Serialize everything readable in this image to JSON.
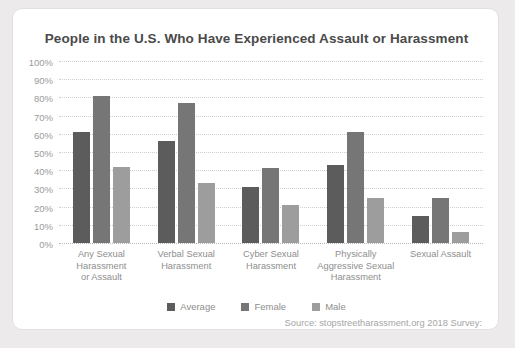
{
  "card": {
    "title": "People in the U.S. Who Have Experienced Assault or Harassment",
    "source": "Source: stopstreetharassment.org 2018 Survey:"
  },
  "legend": {
    "position": "bottom-center",
    "items": [
      {
        "label": "Average",
        "color": "#5c5c5c",
        "swatch": "square-swatch"
      },
      {
        "label": "Female",
        "color": "#767676",
        "swatch": "square-swatch"
      },
      {
        "label": "Male",
        "color": "#9d9d9d",
        "swatch": "square-swatch"
      }
    ]
  },
  "chart_data": {
    "type": "bar",
    "title": "People in the U.S. Who Have Experienced Assault or Harassment",
    "xlabel": "",
    "ylabel": "",
    "ylim": [
      0,
      100
    ],
    "yticks": [
      0,
      10,
      20,
      30,
      40,
      50,
      60,
      70,
      80,
      90,
      100
    ],
    "ytick_labels": [
      "0%",
      "10%",
      "20%",
      "30%",
      "40%",
      "50%",
      "60%",
      "70%",
      "80%",
      "90%",
      "100%"
    ],
    "grid": true,
    "legend_position": "bottom-center",
    "categories": [
      "Any Sexual Harassment or Assault",
      "Verbal Sexual Harassment",
      "Cyber Sexual Harassment",
      "Physically Aggressive Sexual Harassment",
      "Sexual Assault"
    ],
    "category_lines": [
      [
        "Any Sexual",
        "Harassment",
        "or Assault"
      ],
      [
        "Verbal Sexual",
        "Harassment"
      ],
      [
        "Cyber Sexual",
        "Harassment"
      ],
      [
        "Physically",
        "Aggressive Sexual",
        "Harassment"
      ],
      [
        "Sexual Assault"
      ]
    ],
    "series": [
      {
        "name": "Average",
        "color": "#5c5c5c",
        "values": [
          61,
          56,
          31,
          43,
          15
        ]
      },
      {
        "name": "Female",
        "color": "#767676",
        "values": [
          81,
          77,
          41,
          61,
          25
        ]
      },
      {
        "name": "Male",
        "color": "#9d9d9d",
        "values": [
          42,
          33,
          21,
          25,
          6
        ]
      }
    ]
  }
}
